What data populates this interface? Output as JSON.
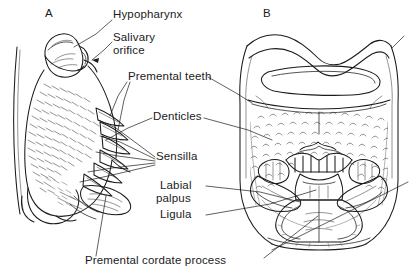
{
  "figure": {
    "background_color": "#ffffff",
    "ink_color": "#1b1b1b",
    "panels": [
      {
        "id": "A",
        "letter": "A",
        "view": "lateral view of labium"
      },
      {
        "id": "B",
        "letter": "B",
        "view": "ventral view of labium"
      }
    ],
    "labels": [
      {
        "key": "hypopharynx",
        "text": "Hypopharynx",
        "target_panel": "A"
      },
      {
        "key": "salivary_orifice_l1",
        "text": "Salivary",
        "target_panel": "A"
      },
      {
        "key": "salivary_orifice_l2",
        "text": "orifice",
        "target_panel": "A"
      },
      {
        "key": "premental_teeth",
        "text": "Premental teeth",
        "target_panel": "B"
      },
      {
        "key": "denticles",
        "text": "Denticles",
        "target_panel": "B"
      },
      {
        "key": "sensilla",
        "text": "Sensilla",
        "target_panel": "A"
      },
      {
        "key": "labial_palpus_l1",
        "text": "Labial",
        "target_panel": "B"
      },
      {
        "key": "labial_palpus_l2",
        "text": "palpus",
        "target_panel": "B"
      },
      {
        "key": "ligula",
        "text": "Ligula",
        "target_panel": "B"
      },
      {
        "key": "premental_cordate_process",
        "text": "Premental cordate process",
        "target_panel": "B"
      }
    ]
  },
  "text": {
    "panel_a": "A",
    "panel_b": "B",
    "hypopharynx": "Hypopharynx",
    "salivary_line1": "Salivary",
    "salivary_line2": "orifice",
    "premental_teeth": "Premental teeth",
    "denticles": "Denticles",
    "sensilla": "Sensilla",
    "labial_line1": "Labial",
    "labial_line2": "palpus",
    "ligula": "Ligula",
    "premental_cordate_process": "Premental cordate process"
  }
}
